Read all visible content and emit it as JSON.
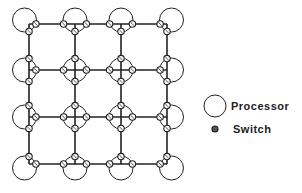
{
  "diagram": {
    "type": "2D mesh interconnection network",
    "rows": 4,
    "cols": 4,
    "grid_x": [
      29,
      75,
      121,
      167
    ],
    "grid_y": [
      24,
      70,
      117,
      164
    ],
    "processor_radius": 12,
    "switch_radius": 3.2,
    "line_color": "#222222"
  },
  "legend": {
    "processor_label": "Processor",
    "switch_label": "Switch"
  }
}
